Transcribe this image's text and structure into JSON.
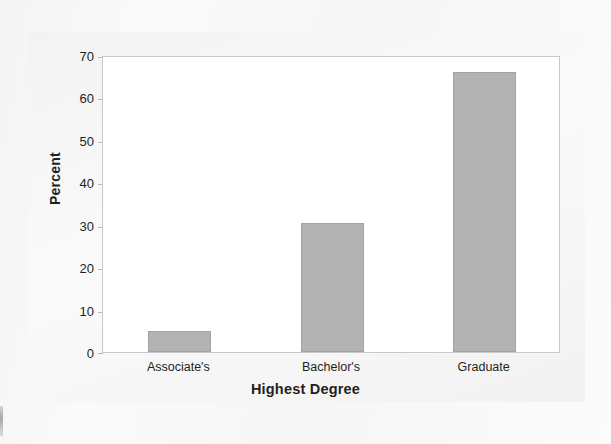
{
  "chart_data": {
    "type": "bar",
    "title": "",
    "categories": [
      "Associate's",
      "Bachelor's",
      "Graduate"
    ],
    "values": [
      5,
      30.5,
      66
    ],
    "xlabel": "Highest Degree",
    "ylabel": "Percent",
    "ylim": [
      0,
      70
    ],
    "yticks": [
      0,
      10,
      20,
      30,
      40,
      50,
      60,
      70
    ],
    "ytick_labels": [
      "0",
      "10",
      "20",
      "30",
      "40",
      "50",
      "60",
      "70"
    ],
    "grid": false,
    "legend": false,
    "legend_position": "none",
    "bar_color": "#b3b3b3",
    "bar_edge_color": "#a3a3a3",
    "plot_background": "#ffffff",
    "figure_background": "#f5f5f5",
    "axis_text_color": "#231f20"
  }
}
